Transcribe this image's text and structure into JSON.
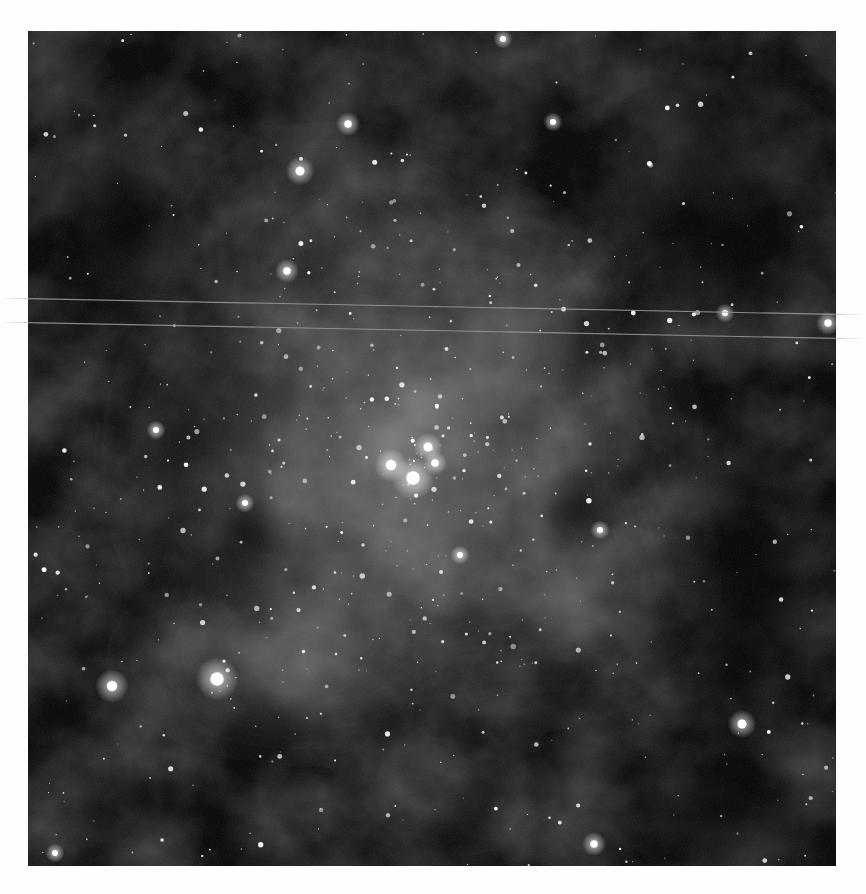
{
  "image": {
    "subject": "star-forming nebula with open star cluster",
    "frame": {
      "x": 28,
      "y": 31,
      "width": 808,
      "height": 835
    },
    "background_color": "#ffffff",
    "sky_color": "#050505",
    "nebula_color": "#8a8a8a",
    "star_color": "#ffffff",
    "streaks": [
      {
        "x1": 0,
        "y1": 298,
        "x2": 866,
        "y2": 315
      },
      {
        "x1": 0,
        "y1": 322,
        "x2": 866,
        "y2": 339
      }
    ],
    "bright_stars": [
      {
        "x": 413,
        "y": 478,
        "r": 9
      },
      {
        "x": 391,
        "y": 465,
        "r": 7
      },
      {
        "x": 428,
        "y": 447,
        "r": 6
      },
      {
        "x": 435,
        "y": 463,
        "r": 5
      },
      {
        "x": 217,
        "y": 679,
        "r": 9
      },
      {
        "x": 112,
        "y": 686,
        "r": 7
      },
      {
        "x": 742,
        "y": 724,
        "r": 6
      },
      {
        "x": 300,
        "y": 171,
        "r": 6
      },
      {
        "x": 348,
        "y": 124,
        "r": 5
      },
      {
        "x": 828,
        "y": 323,
        "r": 5
      },
      {
        "x": 725,
        "y": 313,
        "r": 4
      },
      {
        "x": 287,
        "y": 271,
        "r": 5
      },
      {
        "x": 156,
        "y": 430,
        "r": 4
      },
      {
        "x": 594,
        "y": 844,
        "r": 5
      },
      {
        "x": 55,
        "y": 853,
        "r": 4
      },
      {
        "x": 553,
        "y": 122,
        "r": 4
      },
      {
        "x": 600,
        "y": 530,
        "r": 4
      },
      {
        "x": 460,
        "y": 555,
        "r": 4
      },
      {
        "x": 245,
        "y": 503,
        "r": 4
      },
      {
        "x": 503,
        "y": 39,
        "r": 4
      }
    ],
    "faint_star_count": 650,
    "caption": "· · ·"
  }
}
